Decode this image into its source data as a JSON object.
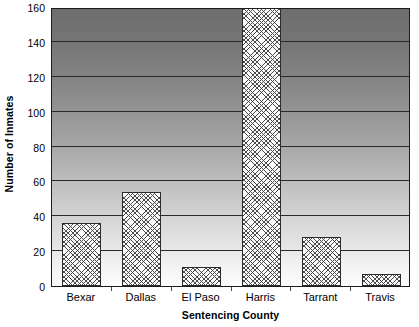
{
  "chart_data": {
    "type": "bar",
    "title": "",
    "subtitle": "",
    "xlabel": "Sentencing County",
    "ylabel": "Number of Inmates",
    "categories": [
      "Bexar",
      "Dallas",
      "El Paso",
      "Harris",
      "Tarrant",
      "Travis"
    ],
    "values": [
      36,
      54,
      11,
      160,
      28,
      7
    ],
    "series": [
      {
        "name": "Number of Inmates",
        "values": [
          36,
          54,
          11,
          160,
          28,
          7
        ]
      }
    ],
    "ylim": [
      0,
      160
    ],
    "yticks": [
      0,
      20,
      40,
      60,
      80,
      100,
      120,
      140,
      160
    ],
    "ytick_labels": [
      "0",
      "20",
      "40",
      "60",
      "80",
      "100",
      "120",
      "140",
      "160"
    ],
    "grid": true,
    "grid_axis": "y",
    "legend": false,
    "legend_position": "none",
    "bar_fill": "crosshatch-diamond",
    "bar_edge_color": "#2b2b2b",
    "plot_background": "vertical-gradient-dark-to-light"
  },
  "axes": {
    "y_title": "Number of Inmates",
    "x_title": "Sentencing County"
  },
  "colors": {
    "axis_line": "#1c1c1c",
    "gridline": "#2a2a2a",
    "bar_edge": "#2b2b2b",
    "bar_face": "#fbfbfb",
    "hatch": "#4a4a4a",
    "background_top": "#6d6d6d",
    "background_bottom": "#fcfcfc",
    "text": "#000000"
  }
}
